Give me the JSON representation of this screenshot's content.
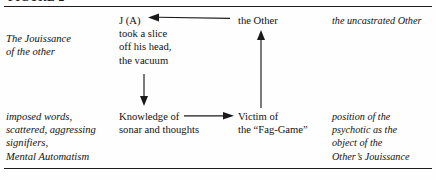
{
  "page": {
    "running_head": "FIGURE 2",
    "rules": [
      "top-rule",
      "bottom-rule"
    ]
  },
  "diagram": {
    "type": "two-row-four-column-schema",
    "top_row": {
      "col1": {
        "style": "italic",
        "lines": [
          "The Jouissance",
          "of the other"
        ]
      },
      "col2": {
        "style": "roman",
        "lines": [
          "J (A)",
          "took a slice",
          "off his head,",
          "the vacuum"
        ]
      },
      "col3": {
        "style": "roman",
        "lines": [
          "the Other"
        ]
      },
      "col4": {
        "style": "italic",
        "lines": [
          "the uncastrated Other"
        ]
      }
    },
    "bottom_row": {
      "col1": {
        "style": "italic",
        "lines": [
          "imposed words,",
          "scattered, aggressing",
          "signifiers,",
          "Mental Automatism"
        ]
      },
      "col2": {
        "style": "roman",
        "lines": [
          "Knowledge of",
          "sonar and thoughts"
        ]
      },
      "col3": {
        "style": "roman",
        "lines": [
          "Victim of",
          "the “Fag-Game”"
        ]
      },
      "col4": {
        "style": "italic",
        "lines": [
          "position of the",
          "psychotic as the",
          "object of the",
          "Other’s Jouissance"
        ]
      }
    },
    "arrows": [
      {
        "name": "arrow-other-to-ja",
        "direction": "left",
        "from": "the Other",
        "to": "J (A)",
        "color": "#1a1a1a"
      },
      {
        "name": "arrow-vacuum-down",
        "direction": "down",
        "from": "the vacuum",
        "to": "Knowledge of sonar and thoughts",
        "color": "#1a1a1a"
      },
      {
        "name": "arrow-knowledge-right",
        "direction": "right",
        "from": "Knowledge of sonar and thoughts",
        "to": "Victim of the “Fag-Game”",
        "color": "#1a1a1a"
      },
      {
        "name": "arrow-victim-up",
        "direction": "up",
        "from": "Victim of the “Fag-Game”",
        "to": "the Other",
        "color": "#1a1a1a"
      }
    ]
  }
}
